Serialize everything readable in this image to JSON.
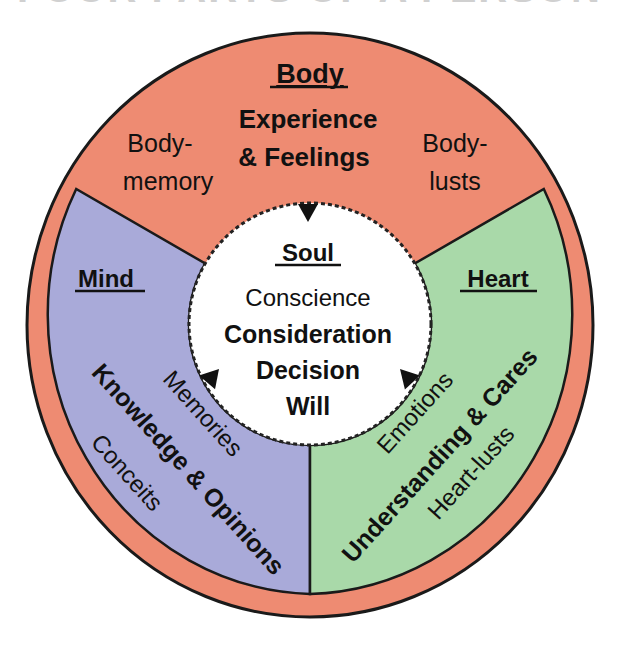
{
  "title": "FOUR PARTS OF A PERSON",
  "colors": {
    "body": "#EE8B72",
    "mind": "#A9AAD9",
    "heart": "#A9D9A9",
    "soul": "#FFFFFF",
    "outline": "#1a1a1a"
  },
  "body": {
    "heading": "Body",
    "main_line1": "Experience",
    "main_line2": "& Feelings",
    "left_line1": "Body-",
    "left_line2": "memory",
    "right_line1": "Body-",
    "right_line2": "lusts"
  },
  "soul": {
    "heading": "Soul",
    "lines": [
      "Conscience",
      "Consideration",
      "Decision",
      "Will"
    ]
  },
  "mind": {
    "heading": "Mind",
    "main": "Knowledge & Opinions",
    "inner": "Memories",
    "outer": "Conceits"
  },
  "heart": {
    "heading": "Heart",
    "main": "Understanding & Cares",
    "inner": "Emotions",
    "outer": "Heart-lusts"
  },
  "arrows": [
    {
      "name": "body-to-soul",
      "direction": "down"
    },
    {
      "name": "mind-to-soul",
      "direction": "down"
    },
    {
      "name": "heart-to-soul",
      "direction": "down"
    }
  ]
}
